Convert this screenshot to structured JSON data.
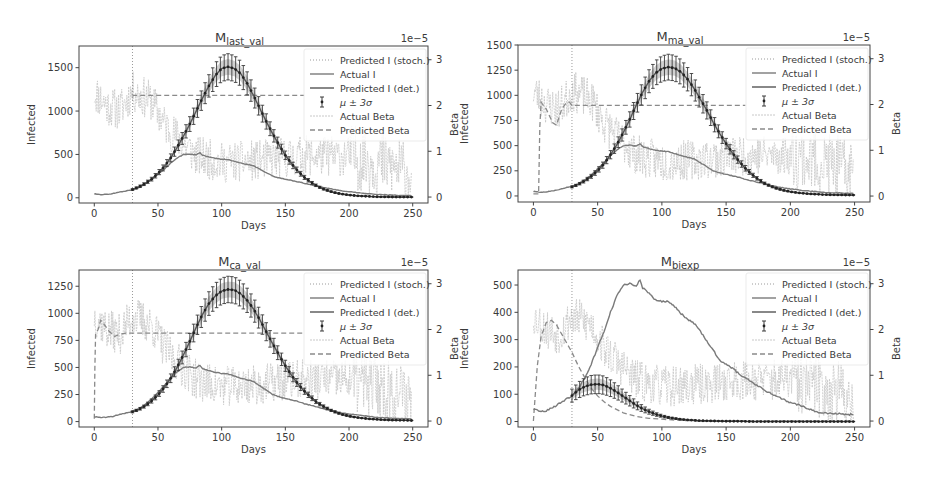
{
  "figure": {
    "panels": 4,
    "layout": "2x2"
  },
  "chart_data": [
    {
      "id": "last_val",
      "type": "line",
      "title_main": "M",
      "title_sub": "last_val",
      "xlabel": "Days",
      "ylabel": "Infected",
      "y2label": "Beta",
      "y2_offset_text": "1e−5",
      "xlim": [
        -12,
        262
      ],
      "ylim": [
        -60,
        1750
      ],
      "y2lim": [
        -0.13,
        3.3
      ],
      "xticks": [
        0,
        50,
        100,
        150,
        200,
        250
      ],
      "yticks": [
        0,
        500,
        1000,
        1500
      ],
      "y2ticks": [
        0,
        1,
        2,
        3
      ],
      "training_cutoff_day": 30,
      "legend": [
        "Predicted I (stoch.)",
        "Actual I",
        "Predicted I (det.)",
        "μ ± 3σ",
        "Actual Beta",
        "Predicted Beta"
      ],
      "actual_I": {
        "x": [
          0,
          5,
          10,
          15,
          20,
          25,
          30,
          35,
          40,
          45,
          50,
          55,
          60,
          65,
          70,
          75,
          80,
          83,
          85,
          90,
          95,
          100,
          105,
          110,
          115,
          120,
          125,
          130,
          135,
          140,
          145,
          150,
          155,
          160,
          165,
          170,
          175,
          180,
          185,
          190,
          195,
          200,
          210,
          220,
          230,
          240,
          249
        ],
        "y": [
          45,
          38,
          40,
          50,
          65,
          80,
          95,
          120,
          160,
          210,
          270,
          330,
          400,
          460,
          500,
          505,
          495,
          520,
          490,
          470,
          455,
          445,
          440,
          420,
          400,
          385,
          370,
          330,
          290,
          250,
          230,
          215,
          200,
          185,
          165,
          150,
          135,
          120,
          105,
          92,
          80,
          70,
          55,
          42,
          33,
          28,
          25
        ]
      },
      "predicted_I_mean": {
        "x": [
          30,
          35,
          40,
          45,
          50,
          55,
          60,
          65,
          70,
          75,
          80,
          85,
          90,
          95,
          100,
          105,
          110,
          115,
          120,
          125,
          130,
          135,
          140,
          145,
          150,
          155,
          160,
          165,
          170,
          175,
          180,
          185,
          190,
          195,
          200,
          205,
          210,
          215,
          220,
          225,
          230,
          235,
          240,
          245,
          249
        ],
        "y": [
          95,
          125,
          165,
          215,
          280,
          360,
          460,
          580,
          710,
          850,
          1000,
          1150,
          1290,
          1410,
          1490,
          1510,
          1490,
          1430,
          1320,
          1180,
          1030,
          880,
          740,
          610,
          490,
          390,
          305,
          235,
          180,
          135,
          100,
          75,
          55,
          42,
          32,
          25,
          20,
          16,
          13,
          11,
          10,
          9,
          8,
          8,
          8
        ]
      },
      "predicted_I_std3_frac": 0.1,
      "actual_beta_seed": 11,
      "actual_beta_profile": {
        "x": [
          0,
          10,
          20,
          30,
          45,
          55,
          65,
          80,
          100,
          130,
          160,
          200,
          230,
          249
        ],
        "y": [
          2.3,
          2.0,
          1.9,
          2.3,
          2.1,
          1.6,
          1.3,
          0.9,
          0.75,
          0.8,
          0.9,
          0.9,
          0.7,
          0.5
        ]
      },
      "actual_beta_noise": 0.45,
      "predicted_beta": {
        "x": [
          30,
          31,
          165
        ],
        "y": [
          2.2,
          2.22,
          2.22
        ]
      }
    },
    {
      "id": "ma_val",
      "type": "line",
      "title_main": "M",
      "title_sub": "ma_val",
      "xlabel": "Days",
      "ylabel": "Infected",
      "y2label": "Beta",
      "y2_offset_text": "1e−5",
      "xlim": [
        -12,
        262
      ],
      "ylim": [
        -60,
        1500
      ],
      "y2lim": [
        -0.13,
        3.3
      ],
      "xticks": [
        0,
        50,
        100,
        150,
        200,
        250
      ],
      "yticks": [
        0,
        250,
        500,
        750,
        1000,
        1250,
        1500
      ],
      "y2ticks": [
        0,
        1,
        2,
        3
      ],
      "training_cutoff_day": 30,
      "legend": [
        "Predicted I (stoch.)",
        "Actual I",
        "Predicted I (det.)",
        "μ ± 3σ",
        "Actual Beta",
        "Predicted Beta"
      ],
      "actual_I": {
        "x": [
          0,
          5,
          10,
          15,
          20,
          25,
          30,
          35,
          40,
          45,
          50,
          55,
          60,
          65,
          70,
          75,
          80,
          83,
          85,
          90,
          95,
          100,
          105,
          110,
          115,
          120,
          125,
          130,
          135,
          140,
          145,
          150,
          155,
          160,
          165,
          170,
          175,
          180,
          185,
          190,
          195,
          200,
          210,
          220,
          230,
          240,
          249
        ],
        "y": [
          45,
          38,
          40,
          50,
          65,
          80,
          95,
          120,
          160,
          210,
          270,
          330,
          400,
          460,
          500,
          505,
          495,
          520,
          490,
          470,
          455,
          445,
          440,
          420,
          400,
          385,
          370,
          330,
          290,
          250,
          230,
          215,
          200,
          185,
          165,
          150,
          135,
          120,
          105,
          92,
          80,
          70,
          55,
          42,
          33,
          28,
          25
        ]
      },
      "predicted_I_mean": {
        "x": [
          30,
          35,
          40,
          45,
          50,
          55,
          60,
          65,
          70,
          75,
          80,
          85,
          90,
          95,
          100,
          105,
          110,
          115,
          120,
          125,
          130,
          135,
          140,
          145,
          150,
          155,
          160,
          165,
          170,
          175,
          180,
          185,
          190,
          195,
          200,
          205,
          210,
          215,
          220,
          225,
          230,
          235,
          240,
          245,
          249
        ],
        "y": [
          90,
          115,
          150,
          195,
          250,
          320,
          410,
          510,
          630,
          760,
          900,
          1030,
          1140,
          1220,
          1265,
          1280,
          1270,
          1230,
          1160,
          1070,
          960,
          850,
          730,
          620,
          520,
          425,
          345,
          275,
          215,
          165,
          125,
          95,
          72,
          55,
          42,
          33,
          26,
          21,
          17,
          14,
          12,
          11,
          10,
          9,
          9
        ]
      },
      "predicted_I_std3_frac": 0.1,
      "actual_beta_seed": 23,
      "actual_beta_profile": {
        "x": [
          0,
          10,
          20,
          30,
          45,
          55,
          65,
          80,
          100,
          130,
          160,
          200,
          230,
          249
        ],
        "y": [
          2.3,
          2.0,
          1.9,
          2.3,
          2.1,
          1.6,
          1.3,
          0.9,
          0.75,
          0.8,
          0.9,
          0.9,
          0.7,
          0.5
        ]
      },
      "actual_beta_noise": 0.45,
      "predicted_beta": {
        "x": [
          0,
          4,
          5,
          6,
          10,
          15,
          18,
          22,
          26,
          28,
          30,
          31,
          165
        ],
        "y": [
          0.05,
          0.05,
          1.5,
          2.05,
          1.9,
          1.6,
          1.55,
          1.9,
          2.05,
          2.05,
          1.98,
          1.98,
          1.98
        ]
      }
    },
    {
      "id": "ca_val",
      "type": "line",
      "title_main": "M",
      "title_sub": "ca_val",
      "xlabel": "Days",
      "ylabel": "Infected",
      "y2label": "Beta",
      "y2_offset_text": "1e−5",
      "xlim": [
        -12,
        262
      ],
      "ylim": [
        -50,
        1400
      ],
      "y2lim": [
        -0.13,
        3.3
      ],
      "xticks": [
        0,
        50,
        100,
        150,
        200,
        250
      ],
      "yticks": [
        0,
        250,
        500,
        750,
        1000,
        1250
      ],
      "y2ticks": [
        0,
        1,
        2,
        3
      ],
      "training_cutoff_day": 30,
      "legend": [
        "Predicted I (stoch.)",
        "Actual I",
        "Predicted I (det.)",
        "μ ± 3σ",
        "Actual Beta",
        "Predicted Beta"
      ],
      "actual_I": {
        "x": [
          0,
          5,
          10,
          15,
          20,
          25,
          30,
          35,
          40,
          45,
          50,
          55,
          60,
          65,
          70,
          75,
          80,
          83,
          85,
          90,
          95,
          100,
          105,
          110,
          115,
          120,
          125,
          130,
          135,
          140,
          145,
          150,
          155,
          160,
          165,
          170,
          175,
          180,
          185,
          190,
          195,
          200,
          210,
          220,
          230,
          240,
          249
        ],
        "y": [
          45,
          38,
          40,
          50,
          65,
          80,
          95,
          120,
          160,
          210,
          270,
          330,
          400,
          460,
          500,
          505,
          495,
          520,
          490,
          470,
          455,
          445,
          440,
          420,
          400,
          385,
          370,
          330,
          290,
          250,
          230,
          215,
          200,
          185,
          165,
          150,
          135,
          120,
          105,
          92,
          80,
          70,
          55,
          42,
          33,
          28,
          25
        ]
      },
      "predicted_I_mean": {
        "x": [
          30,
          35,
          40,
          45,
          50,
          55,
          60,
          65,
          70,
          75,
          80,
          85,
          90,
          95,
          100,
          105,
          110,
          115,
          120,
          125,
          130,
          135,
          140,
          145,
          150,
          155,
          160,
          165,
          170,
          175,
          180,
          185,
          190,
          195,
          200,
          205,
          210,
          215,
          220,
          225,
          230,
          235,
          240,
          245,
          249
        ],
        "y": [
          90,
          112,
          145,
          190,
          245,
          315,
          400,
          500,
          615,
          740,
          870,
          990,
          1090,
          1160,
          1205,
          1220,
          1215,
          1180,
          1120,
          1040,
          940,
          830,
          720,
          615,
          515,
          425,
          345,
          280,
          225,
          175,
          140,
          108,
          84,
          65,
          50,
          40,
          32,
          26,
          21,
          18,
          15,
          13,
          12,
          11,
          10
        ]
      },
      "predicted_I_std3_frac": 0.1,
      "actual_beta_seed": 37,
      "actual_beta_profile": {
        "x": [
          0,
          10,
          20,
          30,
          45,
          55,
          65,
          80,
          100,
          130,
          160,
          200,
          230,
          249
        ],
        "y": [
          2.3,
          2.0,
          1.9,
          2.3,
          2.1,
          1.6,
          1.3,
          0.9,
          0.75,
          0.8,
          0.9,
          0.9,
          0.7,
          0.5
        ]
      },
      "actual_beta_noise": 0.45,
      "predicted_beta": {
        "x": [
          0,
          0.5,
          1,
          3,
          5,
          8,
          12,
          16,
          20,
          25,
          30,
          31,
          165
        ],
        "y": [
          0.05,
          1.2,
          1.9,
          2.0,
          2.2,
          2.1,
          1.95,
          1.85,
          1.9,
          1.92,
          1.92,
          1.92,
          1.92
        ]
      }
    },
    {
      "id": "biexp",
      "type": "line",
      "title_main": "M",
      "title_sub": "biexp",
      "xlabel": "Days",
      "ylabel": "Infected",
      "y2label": "Beta",
      "y2_offset_text": "1e−5",
      "xlim": [
        -12,
        262
      ],
      "ylim": [
        -20,
        555
      ],
      "y2lim": [
        -0.13,
        3.3
      ],
      "xticks": [
        0,
        50,
        100,
        150,
        200,
        250
      ],
      "yticks": [
        0,
        100,
        200,
        300,
        400,
        500
      ],
      "y2ticks": [
        0,
        1,
        2,
        3
      ],
      "training_cutoff_day": 30,
      "legend": [
        "Predicted I (stoch.)",
        "Actual I",
        "Predicted I (det.)",
        "μ ± 3σ",
        "Actual Beta",
        "Predicted Beta"
      ],
      "actual_I": {
        "x": [
          0,
          5,
          10,
          15,
          20,
          25,
          30,
          35,
          40,
          45,
          50,
          55,
          60,
          65,
          70,
          75,
          80,
          83,
          85,
          90,
          95,
          100,
          105,
          110,
          115,
          120,
          125,
          130,
          135,
          140,
          145,
          150,
          155,
          160,
          165,
          170,
          175,
          180,
          185,
          190,
          195,
          200,
          210,
          220,
          230,
          240,
          249
        ],
        "y": [
          45,
          38,
          40,
          50,
          65,
          80,
          95,
          120,
          160,
          210,
          270,
          330,
          400,
          460,
          500,
          505,
          495,
          520,
          490,
          470,
          445,
          440,
          440,
          420,
          395,
          375,
          360,
          330,
          295,
          260,
          225,
          210,
          195,
          175,
          160,
          145,
          130,
          115,
          102,
          90,
          80,
          70,
          55,
          35,
          30,
          28,
          25
        ]
      },
      "predicted_I_mean": {
        "x": [
          30,
          35,
          40,
          45,
          50,
          55,
          60,
          65,
          70,
          75,
          80,
          85,
          90,
          95,
          100,
          105,
          110,
          115,
          120,
          130,
          140,
          150,
          160,
          170,
          180,
          190,
          200,
          210,
          220,
          230,
          240,
          249
        ],
        "y": [
          95,
          115,
          128,
          135,
          137,
          133,
          122,
          108,
          92,
          76,
          60,
          47,
          36,
          27,
          20,
          15,
          11,
          8,
          6,
          3,
          2,
          1,
          1,
          0,
          0,
          0,
          0,
          0,
          0,
          0,
          0,
          0
        ]
      },
      "predicted_I_std3_frac": 0.25,
      "actual_beta_seed": 53,
      "actual_beta_profile": {
        "x": [
          0,
          10,
          20,
          30,
          45,
          55,
          65,
          80,
          100,
          130,
          160,
          200,
          230,
          249
        ],
        "y": [
          2.3,
          2.0,
          1.9,
          2.3,
          2.1,
          1.6,
          1.3,
          0.9,
          0.75,
          0.8,
          0.9,
          0.9,
          0.7,
          0.5
        ]
      },
      "actual_beta_noise": 0.45,
      "predicted_beta": {
        "x": [
          0,
          3,
          6,
          10,
          14,
          18,
          22,
          26,
          30,
          35,
          40,
          45,
          50,
          55,
          60,
          70,
          80,
          90,
          100,
          110,
          120,
          140,
          160,
          200,
          249
        ],
        "y": [
          0.0,
          1.2,
          1.85,
          2.15,
          2.2,
          2.1,
          1.9,
          1.7,
          1.5,
          1.2,
          0.95,
          0.72,
          0.55,
          0.42,
          0.32,
          0.18,
          0.1,
          0.06,
          0.04,
          0.02,
          0.01,
          0.0,
          0.0,
          0.0,
          0.0
        ]
      }
    }
  ],
  "panel_boxes": [
    {
      "left": 79,
      "top": 46,
      "width": 349,
      "height": 157
    },
    {
      "left": 518,
      "top": 45,
      "width": 352,
      "height": 157
    },
    {
      "left": 79,
      "top": 270,
      "width": 349,
      "height": 157
    },
    {
      "left": 518,
      "top": 270,
      "width": 352,
      "height": 157
    }
  ],
  "colors": {
    "axes": "#444444",
    "actual_I": "#7a7a7a",
    "predicted_I": "#555555",
    "errorbar": "#3a3a3a",
    "stoch": "#9a9a9a",
    "actual_beta": "#c8c8c8",
    "predicted_beta": "#8a8a8a",
    "cutoff": "#9a9a9a"
  }
}
